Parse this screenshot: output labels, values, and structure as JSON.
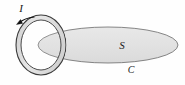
{
  "figure": {
    "background_color": "#fefefe",
    "labels": {
      "current": "I",
      "surface": "S",
      "contour": "C"
    },
    "icons": {
      "current_direction": "arrowhead-icon",
      "loop": "current-loop-icon",
      "surface": "ellipse-surface-icon"
    },
    "colors": {
      "surface_fill": "#e3e3e3",
      "surface_stroke": "#5a5a5a",
      "loop_fill": "#dcdcdc",
      "loop_stroke": "#3a3a3a",
      "label_color": "#1a1a1a",
      "arrow_color": "#111111"
    },
    "geometry": {
      "loop_center_x": 41,
      "loop_center_y": 45,
      "loop_outer_rx": 25,
      "loop_outer_ry": 30,
      "loop_inner_rx": 20,
      "loop_inner_ry": 25,
      "surface_center_x": 108,
      "surface_center_y": 45,
      "surface_rx": 70,
      "surface_ry": 18
    },
    "label_positions": {
      "current": {
        "x": 21,
        "y": 12
      },
      "surface": {
        "x": 122,
        "y": 49
      },
      "contour": {
        "x": 131,
        "y": 73
      }
    }
  }
}
